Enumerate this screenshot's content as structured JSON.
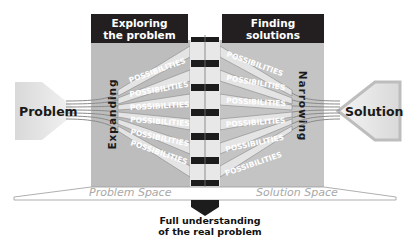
{
  "headers": {
    "left": [
      "Exploring",
      "the problem"
    ],
    "right": "Finding solutions"
  },
  "endpoints": {
    "left": "Problem",
    "right": "Solution"
  },
  "phases": {
    "left": "Expanding",
    "right": "Narrowing"
  },
  "possibility_label": "POSSIBILITIES",
  "possibilities_count_per_side": 6,
  "spaces": {
    "left": "Problem Space",
    "right": "Solution Space"
  },
  "caption": [
    "Full understanding",
    "of the real problem"
  ],
  "colors": {
    "header_bg": "#231f20",
    "panel_gray": "#bdbdbd",
    "band_light": "#e2e2e2",
    "black_bar": "#1c1c1c",
    "space_text": "#a8a8a8"
  }
}
